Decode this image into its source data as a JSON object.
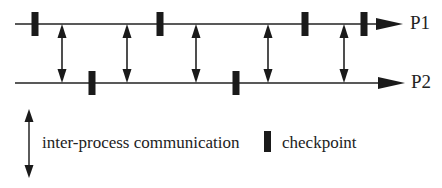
{
  "diagram": {
    "title": "",
    "processes": [
      {
        "id": "P1",
        "label": "P1",
        "y": 24,
        "checkpoints_x": [
          35,
          160,
          305,
          364
        ]
      },
      {
        "id": "P2",
        "label": "P2",
        "y": 83,
        "checkpoints_x": [
          92,
          236
        ]
      }
    ],
    "communications_x": [
      62,
      127,
      196,
      268,
      344
    ],
    "legend": {
      "communication_label": "inter-process communication",
      "checkpoint_label": "checkpoint"
    },
    "colors": {
      "line": "#222222",
      "checkpoint": "#1a1a1a",
      "background": "#ffffff"
    }
  }
}
